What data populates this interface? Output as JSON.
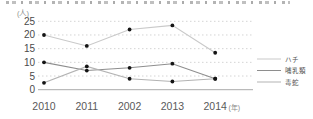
{
  "chart_data": {
    "type": "line",
    "title": "",
    "categories": [
      "2010",
      "2011",
      "2002",
      "2013",
      "2014"
    ],
    "series": [
      {
        "name": "ハチ",
        "color": "#c9c9c9",
        "values": [
          20,
          16,
          22,
          23.5,
          13.5
        ]
      },
      {
        "name": "哺乳類",
        "color": "#8e8e8e",
        "values": [
          10,
          7,
          8,
          9.5,
          4
        ]
      },
      {
        "name": "毒蛇",
        "color": "#b3b3b3",
        "values": [
          2.5,
          8.5,
          4,
          3,
          4
        ]
      }
    ],
    "marker_color": "#141414",
    "xlabel": "(年)",
    "ylabel": "(人)",
    "ylim": [
      0,
      25
    ],
    "yticks": [
      0,
      5,
      10,
      15,
      20,
      25
    ],
    "grid": true,
    "legend_position": "right",
    "axis_color": "#ababab",
    "grid_color": "#d4d4d4",
    "tick_label_color": "#4a4a4a",
    "x_label_color": "#5a5a5a",
    "unit_label_color": "#8a8a8a",
    "legend_text_color": "#555555"
  }
}
